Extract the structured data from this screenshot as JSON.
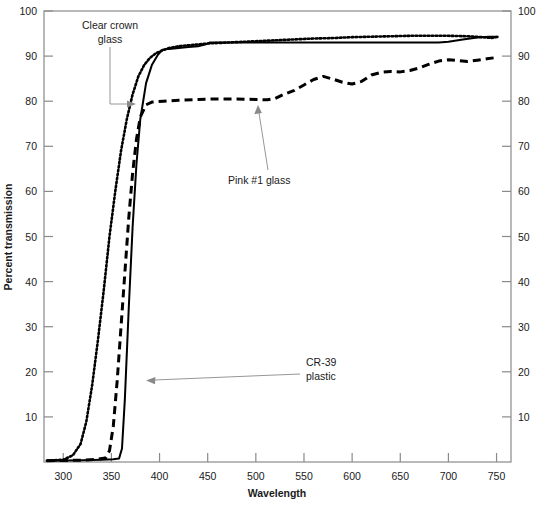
{
  "chart_data": {
    "type": "line",
    "title": "",
    "xlabel": "Wavelength",
    "ylabel": "Percent transmission",
    "xlim": [
      280,
      765
    ],
    "ylim": [
      0,
      100
    ],
    "grid": false,
    "legend_position": "inline-annotations",
    "x_ticks": [
      300,
      350,
      400,
      450,
      500,
      550,
      600,
      650,
      700,
      750
    ],
    "y_ticks": [
      10,
      20,
      30,
      40,
      50,
      60,
      70,
      80,
      90,
      100
    ],
    "y_ticks_right": [
      10,
      20,
      30,
      40,
      50,
      60,
      70,
      80,
      90,
      100
    ],
    "series": [
      {
        "name": "Clear crown glass",
        "style": "dotted",
        "x": [
          283,
          300,
          310,
          318,
          324,
          330,
          336,
          342,
          348,
          354,
          360,
          366,
          372,
          378,
          384,
          390,
          396,
          402,
          410,
          420,
          430,
          440,
          450,
          460,
          480,
          500,
          520,
          540,
          560,
          580,
          600,
          620,
          640,
          660,
          680,
          700,
          720,
          735,
          745,
          752
        ],
        "y": [
          0.3,
          0.5,
          1.5,
          4,
          9,
          17,
          27,
          38,
          50,
          60,
          69,
          76,
          81.5,
          85.5,
          88,
          89.6,
          90.6,
          91.2,
          91.8,
          92.2,
          92.4,
          92.6,
          92.8,
          92.9,
          93.1,
          93.3,
          93.5,
          93.7,
          93.9,
          94.0,
          94.2,
          94.3,
          94.4,
          94.5,
          94.5,
          94.5,
          94.4,
          94.2,
          94.0,
          94.3
        ]
      },
      {
        "name": "CR-39 plastic",
        "style": "solid",
        "x": [
          283,
          320,
          340,
          352,
          358,
          361,
          364,
          368,
          372,
          376,
          380,
          386,
          392,
          398,
          403,
          410,
          420,
          430,
          440,
          448,
          452,
          470,
          500,
          540,
          580,
          620,
          660,
          690,
          700,
          715,
          730,
          742,
          752
        ],
        "y": [
          0.3,
          0.4,
          0.5,
          0.6,
          0.8,
          3,
          14,
          34,
          52,
          66,
          76,
          84,
          88,
          90.2,
          91.4,
          91.6,
          91.8,
          92.0,
          92.2,
          92.6,
          93.0,
          93.0,
          93.0,
          93.0,
          93.0,
          93.0,
          93.0,
          93.0,
          93.2,
          93.7,
          94.1,
          94.3,
          94.3
        ]
      },
      {
        "name": "Pink #1 glass",
        "style": "dashed",
        "x": [
          283,
          320,
          335,
          344,
          348,
          352,
          356,
          360,
          364,
          368,
          372,
          376,
          380,
          386,
          392,
          398,
          404,
          410,
          420,
          440,
          460,
          480,
          500,
          512,
          520,
          530,
          540,
          550,
          560,
          570,
          580,
          590,
          600,
          610,
          620,
          630,
          640,
          650,
          660,
          670,
          680,
          690,
          700,
          710,
          720,
          730,
          740,
          750
        ],
        "y": [
          0.3,
          0.4,
          0.6,
          0.9,
          2.5,
          8,
          18,
          30,
          42,
          54,
          64,
          71.5,
          76.5,
          79.2,
          79.8,
          79.9,
          80.0,
          80.1,
          80.2,
          80.4,
          80.5,
          80.5,
          80.4,
          80.3,
          80.6,
          81.6,
          82.4,
          83.6,
          84.8,
          85.5,
          84.9,
          84.2,
          83.8,
          84.4,
          85.8,
          86.4,
          86.6,
          86.5,
          86.8,
          87.4,
          88.2,
          88.9,
          89.2,
          89.0,
          88.8,
          89.1,
          89.4,
          89.7
        ]
      }
    ],
    "annotations": [
      {
        "id": "clear-crown-glass",
        "line1": "Clear crown",
        "line2": "glass"
      },
      {
        "id": "pink-1-glass",
        "line1": "Pink #1 glass",
        "line2": ""
      },
      {
        "id": "cr-39-plastic",
        "line1": "CR-39",
        "line2": "plastic"
      }
    ],
    "colors": {
      "line": "#000000",
      "axis": "#8a8a8a",
      "text": "#1a1a1a",
      "background": "#ffffff"
    }
  }
}
